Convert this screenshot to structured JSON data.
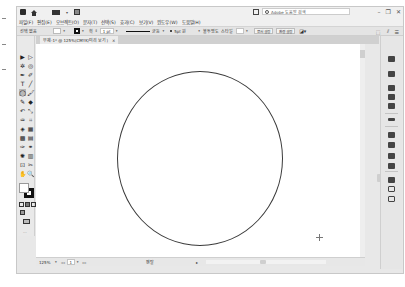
{
  "app": {
    "name": "Adobe Illustrator",
    "title_bar": {
      "search_placeholder": "Adobe 도움말 검색",
      "window_controls": {
        "minimize": "–",
        "restore": "❐",
        "close": "✕"
      }
    },
    "menu": [
      "파일(F)",
      "편집(E)",
      "오브젝트(O)",
      "문자(T)",
      "선택(S)",
      "효과(C)",
      "보기(V)",
      "윈도우(W)",
      "도움말(H)"
    ]
  },
  "control_bar": {
    "selection_label": "선택 없음",
    "stroke_label": "획",
    "stroke_weight": "1 pt",
    "stroke_profile": "균등",
    "brush": "5pt 원",
    "opacity_label": "불투명도",
    "style_label": "스타일",
    "doc_setup_button": "문서 설정",
    "prefs_button": "환경 설정"
  },
  "document": {
    "tab_title": "무제-1* @ 125%(CMYK/미리 보기)",
    "tab_close": "×",
    "zoom_level": "125%",
    "page_number": "1",
    "status_text": "펜탈"
  },
  "canvas": {
    "shapes": [
      {
        "type": "ellipse",
        "stroke": "#3a3a3a",
        "fill": "none"
      }
    ],
    "cursor": "crosshair"
  },
  "tools": [
    {
      "name": "selection",
      "glyph": "▶"
    },
    {
      "name": "direct-selection",
      "glyph": "▷"
    },
    {
      "name": "magic-wand",
      "glyph": "✲"
    },
    {
      "name": "lasso",
      "glyph": "◎"
    },
    {
      "name": "pen",
      "glyph": "✒"
    },
    {
      "name": "curvature",
      "glyph": "✐"
    },
    {
      "name": "type",
      "glyph": "T"
    },
    {
      "name": "line",
      "glyph": "╱"
    },
    {
      "name": "ellipse",
      "glyph": "◯"
    },
    {
      "name": "paintbrush",
      "glyph": "🖌"
    },
    {
      "name": "shaper",
      "glyph": "✎"
    },
    {
      "name": "eraser",
      "glyph": "◆"
    },
    {
      "name": "rotate",
      "glyph": "↶"
    },
    {
      "name": "scale",
      "glyph": "⤡"
    },
    {
      "name": "warp",
      "glyph": "♒"
    },
    {
      "name": "free-transform",
      "glyph": "⌗"
    },
    {
      "name": "shape-builder",
      "glyph": "◈"
    },
    {
      "name": "perspective-grid",
      "glyph": "▦"
    },
    {
      "name": "mesh",
      "glyph": "▩"
    },
    {
      "name": "gradient",
      "glyph": "▤"
    },
    {
      "name": "eyedropper",
      "glyph": "✑"
    },
    {
      "name": "blend",
      "glyph": "⚭"
    },
    {
      "name": "symbol-sprayer",
      "glyph": "✺"
    },
    {
      "name": "column-graph",
      "glyph": "▥"
    },
    {
      "name": "artboard",
      "glyph": "⊡"
    },
    {
      "name": "slice",
      "glyph": "✂"
    },
    {
      "name": "hand",
      "glyph": "✋"
    },
    {
      "name": "zoom",
      "glyph": "🔍"
    }
  ],
  "colors": {
    "app_bg": "#e8e8e8",
    "canvas_bg": "#ffffff",
    "active_tool": "#b8b8b8",
    "stroke": "#111111"
  }
}
